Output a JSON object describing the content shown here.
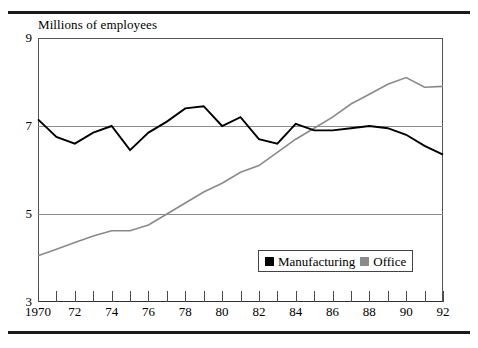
{
  "chart_data": {
    "type": "line",
    "title": "Millions of employees",
    "xlabel": "",
    "ylabel": "Millions of employees",
    "ylim": [
      3,
      9
    ],
    "xlim": [
      1970,
      1992
    ],
    "ytick_labels": [
      "9",
      "7",
      "5",
      "3"
    ],
    "ytick_values": [
      9,
      7,
      5,
      3
    ],
    "gridlines": [
      7,
      5
    ],
    "grid": true,
    "legend_position": "bottom-right",
    "x": [
      1970,
      1971,
      1972,
      1973,
      1974,
      1975,
      1976,
      1977,
      1978,
      1979,
      1980,
      1981,
      1982,
      1983,
      1984,
      1985,
      1986,
      1987,
      1988,
      1989,
      1990,
      1991,
      1992
    ],
    "xtick_labels": [
      "1970",
      "",
      "72",
      "",
      "74",
      "",
      "76",
      "",
      "78",
      "",
      "80",
      "",
      "82",
      "",
      "84",
      "",
      "86",
      "",
      "88",
      "",
      "90",
      "",
      "92"
    ],
    "series": [
      {
        "name": "Manufacturing",
        "color": "#000000",
        "values": [
          7.15,
          6.75,
          6.6,
          6.85,
          7.0,
          6.45,
          6.85,
          7.1,
          7.4,
          7.45,
          7.0,
          7.2,
          6.7,
          6.6,
          7.05,
          6.9,
          6.9,
          6.95,
          7.0,
          6.95,
          6.8,
          6.55,
          6.35
        ]
      },
      {
        "name": "Office",
        "color": "#8a8a8a",
        "values": [
          4.05,
          4.2,
          4.35,
          4.5,
          4.62,
          4.62,
          4.75,
          5.0,
          5.25,
          5.5,
          5.7,
          5.95,
          6.1,
          6.4,
          6.7,
          6.95,
          7.2,
          7.5,
          7.72,
          7.95,
          8.1,
          7.88,
          7.9
        ]
      }
    ]
  },
  "legend": {
    "items": [
      {
        "label": "Manufacturing",
        "color": "#000000",
        "swatch": "filled-square"
      },
      {
        "label": "Office",
        "color": "#8a8a8a",
        "swatch": "filled-square"
      }
    ]
  }
}
